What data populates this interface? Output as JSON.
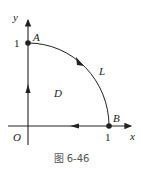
{
  "figure": {
    "caption": "图 6-46",
    "axes": {
      "x_label": "x",
      "y_label": "y",
      "origin_label": "O",
      "x_tick_label": "1",
      "y_tick_label": "1"
    },
    "points": [
      {
        "name": "A",
        "x": 0,
        "y": 1
      },
      {
        "name": "B",
        "x": 1,
        "y": 0
      }
    ],
    "curve": {
      "label": "L",
      "type": "quarter-circle arc",
      "from": "A",
      "to": "B",
      "direction": "clockwise"
    },
    "region": {
      "label": "D"
    },
    "boundary_direction": {
      "arc": "A to B",
      "x_axis_segment": "B to O (leftward)",
      "y_axis_segment": "O to A (upward)"
    },
    "colors": {
      "line": "#222222",
      "caption": "#555555"
    }
  }
}
